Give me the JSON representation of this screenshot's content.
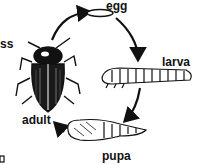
{
  "diagram": {
    "type": "life-cycle",
    "stages": [
      {
        "id": "egg",
        "label": "egg"
      },
      {
        "id": "larva",
        "label": "larva"
      },
      {
        "id": "pupa",
        "label": "pupa"
      },
      {
        "id": "adult",
        "label": "adult"
      }
    ],
    "cut_labels": {
      "left_edge": "ss",
      "bottom_left": "o"
    },
    "arrows": [
      {
        "from": "adult",
        "to": "egg"
      },
      {
        "from": "egg",
        "to": "larva"
      },
      {
        "from": "larva",
        "to": "pupa"
      },
      {
        "from": "pupa",
        "to": "adult"
      }
    ]
  }
}
